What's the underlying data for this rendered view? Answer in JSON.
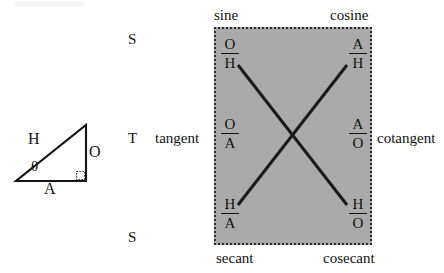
{
  "figure": {
    "triangle": {
      "hypotenuse_label": "H",
      "opposite_label": "O",
      "adjacent_label": "A",
      "angle_label": "θ",
      "right_angle_marker": "right-angle-square"
    },
    "row_letters": {
      "top": "S",
      "middle": "T",
      "bottom": "S"
    },
    "outer_labels": {
      "tangent": "tangent",
      "cotangent": "cotangent",
      "sine": "sine",
      "cosine": "cosine",
      "secant": "secant",
      "cosecant": "cosecant"
    },
    "box": {
      "fill_color": "#aaaaaa",
      "border_style": "dotted",
      "border_color": "#2a2a2a"
    },
    "ratios": [
      {
        "name": "sine",
        "numerator": "O",
        "denominator": "H",
        "row": "top",
        "column": "left"
      },
      {
        "name": "cosine",
        "numerator": "A",
        "denominator": "H",
        "row": "top",
        "column": "right"
      },
      {
        "name": "tangent",
        "numerator": "O",
        "denominator": "A",
        "row": "middle",
        "column": "left"
      },
      {
        "name": "cotangent",
        "numerator": "A",
        "denominator": "O",
        "row": "middle",
        "column": "right"
      },
      {
        "name": "secant",
        "numerator": "H",
        "denominator": "A",
        "row": "bottom",
        "column": "left"
      },
      {
        "name": "cosecant",
        "numerator": "H",
        "denominator": "O",
        "row": "bottom",
        "column": "right"
      }
    ],
    "cross_lines": {
      "description": "two diagonal reciprocal lines forming an X",
      "color": "#1a1a1a"
    }
  }
}
